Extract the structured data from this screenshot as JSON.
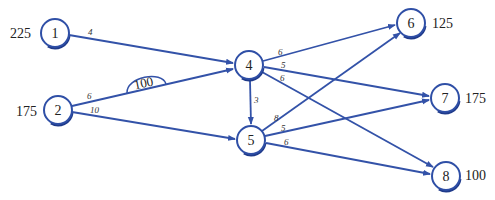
{
  "diagram": {
    "type": "transportation-network",
    "nodes": [
      {
        "id": "1",
        "label": "1",
        "x": 55,
        "y": 33,
        "supply_label": "225",
        "supply_side": "left"
      },
      {
        "id": "2",
        "label": "2",
        "x": 58,
        "y": 110,
        "supply_label": "175",
        "supply_side": "left"
      },
      {
        "id": "4",
        "label": "4",
        "x": 249,
        "y": 65,
        "supply_label": "",
        "supply_side": "none"
      },
      {
        "id": "5",
        "label": "5",
        "x": 251,
        "y": 140,
        "supply_label": "",
        "supply_side": "none"
      },
      {
        "id": "6",
        "label": "6",
        "x": 411,
        "y": 23,
        "supply_label": "125",
        "supply_side": "right"
      },
      {
        "id": "7",
        "label": "7",
        "x": 445,
        "y": 98,
        "supply_label": "175",
        "supply_side": "right"
      },
      {
        "id": "8",
        "label": "8",
        "x": 446,
        "y": 176,
        "supply_label": "100",
        "supply_side": "right"
      }
    ],
    "edges": [
      {
        "from": "1",
        "to": "4",
        "cost": "4"
      },
      {
        "from": "2",
        "to": "4",
        "cost": "6"
      },
      {
        "from": "2",
        "to": "5",
        "cost": "10"
      },
      {
        "from": "4",
        "to": "5",
        "cost": "3"
      },
      {
        "from": "4",
        "to": "6",
        "cost": "6"
      },
      {
        "from": "4",
        "to": "7",
        "cost": "5"
      },
      {
        "from": "4",
        "to": "8",
        "cost": "6"
      },
      {
        "from": "5",
        "to": "6",
        "cost": "8"
      },
      {
        "from": "5",
        "to": "7",
        "cost": "5"
      },
      {
        "from": "5",
        "to": "8",
        "cost": "6"
      }
    ],
    "capacity": {
      "edge": "2-4",
      "label": "100"
    },
    "colors": {
      "edge": "#3352a8",
      "node_stroke": "#2f4fa6",
      "text": "#222222"
    }
  }
}
